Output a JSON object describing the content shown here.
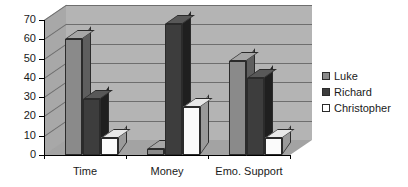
{
  "chart_data": {
    "type": "bar",
    "title": "",
    "subtitle": "",
    "xlabel": "",
    "ylabel": "",
    "categories": [
      "Time",
      "Money",
      "Emo. Support"
    ],
    "series": [
      {
        "name": "Luke",
        "values": [
          60,
          3,
          49
        ],
        "color": "#8a8a8a"
      },
      {
        "name": "Richard",
        "values": [
          29,
          68,
          40
        ],
        "color": "#3d3d3d"
      },
      {
        "name": "Christopher",
        "values": [
          9,
          25,
          9
        ],
        "color": "#ffffff"
      }
    ],
    "ylim": [
      0,
      70
    ],
    "ytick_step": 10,
    "yticks": [
      0,
      10,
      20,
      30,
      40,
      50,
      60,
      70
    ],
    "ytick_labels": [
      "0",
      "10",
      "20",
      "30",
      "40",
      "50",
      "60",
      "70"
    ],
    "grid": true,
    "grid_axis": "y",
    "legend_position": "right",
    "style": "3d-column",
    "plot_area_color": "#b4b4b4",
    "background_color": "#ffffff"
  },
  "legend": {
    "items": [
      {
        "label": "Luke",
        "swatch": "luke-swatch"
      },
      {
        "label": "Richard",
        "swatch": "richard-swatch"
      },
      {
        "label": "Christopher",
        "swatch": "christopher-swatch"
      }
    ]
  }
}
